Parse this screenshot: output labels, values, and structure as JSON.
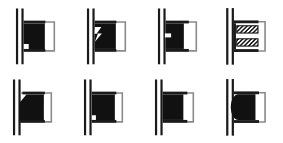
{
  "figure": {
    "background_color": "#ffffff",
    "line_color": "#1a1a1a",
    "fill_color": "#111111",
    "rows": 2,
    "columns": 4,
    "width": 283,
    "height": 143
  },
  "cells": [
    {
      "index": 1,
      "position": "row-1-col-1",
      "name": "seal-profile-stepped-lip",
      "description": "Square seal body with small stepped notch cut at lower-left corner",
      "feature": "stepped-lip-notch",
      "fill": "#111111"
    },
    {
      "index": 2,
      "position": "row-1-col-2",
      "name": "seal-profile-zigzag-lip",
      "description": "Square seal body with zigzag lightning-shaped slit cut into left face",
      "feature": "zigzag-slit",
      "fill": "#111111"
    },
    {
      "index": 3,
      "position": "row-1-col-3",
      "name": "seal-profile-slotted-lip",
      "description": "Square seal body with horizontal rectangular slot cut into left face",
      "feature": "horizontal-slot",
      "fill": "#111111"
    },
    {
      "index": 4,
      "position": "row-1-col-4",
      "name": "seal-profile-hatched-spring",
      "description": "Two hatched bands representing a coil spring energized seal",
      "feature": "double-hatched-bands",
      "fill": "#ffffff"
    },
    {
      "index": 5,
      "position": "row-2-col-1",
      "name": "seal-profile-chamfered",
      "description": "Solid seal body with chamfered angled upper-left corner",
      "feature": "chamfer-top-left",
      "fill": "#111111"
    },
    {
      "index": 6,
      "position": "row-2-col-2",
      "name": "seal-profile-square-offset",
      "description": "Solid square seal body offset with small step at lower-left",
      "feature": "offset-step",
      "fill": "#111111"
    },
    {
      "index": 7,
      "position": "row-2-col-3",
      "name": "seal-profile-square-plain",
      "description": "Plain solid square seal body",
      "feature": "plain-square",
      "fill": "#111111"
    },
    {
      "index": 8,
      "position": "row-2-col-4",
      "name": "seal-profile-rounded",
      "description": "Solid seal body with rounded convex left face",
      "feature": "rounded-left-face",
      "fill": "#111111"
    }
  ]
}
